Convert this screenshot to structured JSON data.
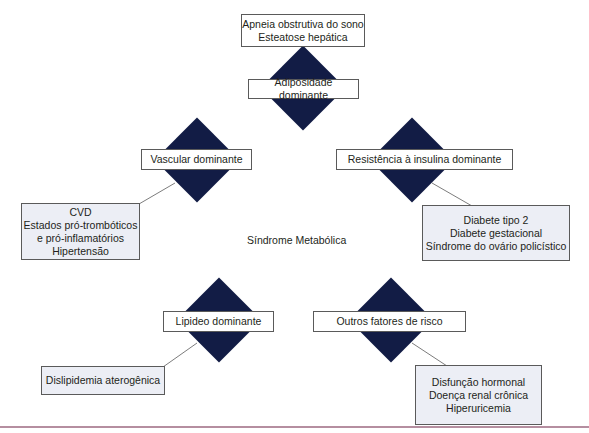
{
  "colors": {
    "diamond": "#121c45",
    "box_border": "#5a5a5a",
    "shaded_box": "#eceef5",
    "connector": "#5a5a5a",
    "bottom_rule": "#b58ea0"
  },
  "diagram": {
    "center_label": "Síndrome Metabólica",
    "nodes": [
      {
        "id": "adiposidade",
        "label": "Adiposidade dominante",
        "outcomes": [
          "Apneia obstrutiva do sono",
          "Esteatose hepática"
        ]
      },
      {
        "id": "vascular",
        "label": "Vascular dominante",
        "outcomes": [
          "CVD",
          "Estados pró-trombóticos",
          "e pró-inflamatórios",
          "Hipertensão"
        ]
      },
      {
        "id": "resistencia",
        "label": "Resistência à insulina dominante",
        "outcomes": [
          "Diabete tipo 2",
          "Diabete gestacional",
          "Síndrome do ovário policístico"
        ]
      },
      {
        "id": "lipideo",
        "label": "Lipideo dominante",
        "outcomes": [
          "Dislipidemia aterogênica"
        ]
      },
      {
        "id": "outros",
        "label": "Outros fatores de risco",
        "outcomes": [
          "Disfunção hormonal",
          "Doença renal crônica",
          "Hiperuricemia"
        ]
      }
    ]
  }
}
